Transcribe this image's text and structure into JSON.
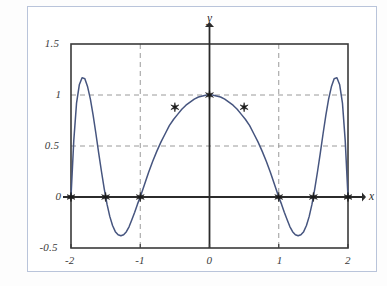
{
  "figure": {
    "background_color": "#ffffff",
    "border_color": "#b9c4da",
    "curve_color": "#46557f",
    "axis_color": "#2b2b2b",
    "frame_color": "#3a3a3a",
    "grid_color": "#9a9a9a",
    "marker_color": "#1a1a1a"
  },
  "chart_data": {
    "type": "line",
    "title": "",
    "xlabel": "x",
    "ylabel": "y",
    "xlim": [
      -2,
      2
    ],
    "ylim": [
      -0.5,
      1.5
    ],
    "grid": true,
    "grid_style": "dashed",
    "legend": "none",
    "x_ticks": [
      "-2",
      "-1",
      "0",
      "1",
      "2"
    ],
    "x_tick_values": [
      -2,
      -1,
      0,
      1,
      2
    ],
    "y_ticks": [
      "1.5",
      "1",
      "0.5",
      "0",
      "-0.5"
    ],
    "y_tick_values": [
      1.5,
      1,
      0.5,
      0,
      -0.5
    ],
    "grid_x_values": [
      -1,
      1
    ],
    "grid_y_values": [
      1,
      0.5
    ],
    "series": [
      {
        "name": "curve",
        "style": "solid",
        "color": "#46557f",
        "x": [
          -2.0,
          -1.96,
          -1.92,
          -1.88,
          -1.84,
          -1.8,
          -1.76,
          -1.72,
          -1.68,
          -1.64,
          -1.6,
          -1.56,
          -1.52,
          -1.48,
          -1.44,
          -1.4,
          -1.36,
          -1.32,
          -1.28,
          -1.24,
          -1.2,
          -1.16,
          -1.12,
          -1.08,
          -1.04,
          -1.0,
          -0.94,
          -0.88,
          -0.82,
          -0.76,
          -0.7,
          -0.64,
          -0.58,
          -0.52,
          -0.46,
          -0.4,
          -0.34,
          -0.28,
          -0.22,
          -0.16,
          -0.1,
          -0.04,
          0.0,
          0.04,
          0.1,
          0.16,
          0.22,
          0.28,
          0.34,
          0.4,
          0.46,
          0.52,
          0.58,
          0.64,
          0.7,
          0.76,
          0.82,
          0.88,
          0.94,
          1.0,
          1.04,
          1.08,
          1.12,
          1.16,
          1.2,
          1.24,
          1.28,
          1.32,
          1.36,
          1.4,
          1.44,
          1.48,
          1.52,
          1.56,
          1.6,
          1.64,
          1.68,
          1.72,
          1.76,
          1.8,
          1.84,
          1.88,
          1.92,
          1.96,
          2.0
        ],
        "y": [
          0.0,
          0.55,
          0.92,
          1.1,
          1.17,
          1.16,
          1.08,
          0.96,
          0.8,
          0.62,
          0.43,
          0.25,
          0.08,
          -0.07,
          -0.19,
          -0.28,
          -0.34,
          -0.37,
          -0.38,
          -0.37,
          -0.34,
          -0.29,
          -0.22,
          -0.15,
          -0.07,
          0.0,
          0.12,
          0.24,
          0.35,
          0.45,
          0.54,
          0.62,
          0.7,
          0.76,
          0.81,
          0.86,
          0.9,
          0.93,
          0.96,
          0.98,
          0.99,
          1.0,
          1.0,
          1.0,
          0.99,
          0.98,
          0.96,
          0.93,
          0.9,
          0.86,
          0.81,
          0.76,
          0.7,
          0.62,
          0.54,
          0.45,
          0.35,
          0.24,
          0.12,
          0.0,
          -0.07,
          -0.15,
          -0.22,
          -0.29,
          -0.34,
          -0.37,
          -0.38,
          -0.37,
          -0.34,
          -0.28,
          -0.19,
          -0.07,
          0.08,
          0.25,
          0.43,
          0.62,
          0.8,
          0.96,
          1.08,
          1.16,
          1.17,
          1.1,
          0.92,
          0.55,
          0.0
        ]
      }
    ],
    "markers": {
      "name": "nodes",
      "symbol": "star",
      "points": [
        {
          "x": -2.0,
          "y": 0.0
        },
        {
          "x": -1.5,
          "y": 0.0
        },
        {
          "x": -1.0,
          "y": 0.0
        },
        {
          "x": -0.5,
          "y": 0.88
        },
        {
          "x": 0.0,
          "y": 1.0
        },
        {
          "x": 0.5,
          "y": 0.88
        },
        {
          "x": 1.0,
          "y": 0.0
        },
        {
          "x": 1.5,
          "y": 0.0
        },
        {
          "x": 2.0,
          "y": 0.0
        }
      ]
    }
  }
}
